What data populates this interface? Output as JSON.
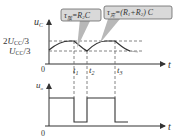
{
  "top_plot": {
    "y_label": "u",
    "y_label_sub": "C",
    "x_label": "t",
    "origin": "0",
    "levels": [
      {
        "label_coef": "2",
        "label_var": "U",
        "label_sub": "CC",
        "label_div": "/3"
      },
      {
        "label_coef": "",
        "label_var": "U",
        "label_sub": "CC",
        "label_div": "/3"
      }
    ],
    "callouts": [
      {
        "tau": "τ",
        "tau_sub": "放",
        "eq": "=R",
        "r_sub": "2",
        "tail": "C"
      },
      {
        "tau": "τ",
        "tau_sub": "充",
        "eq": "=(R",
        "r1_sub": "1",
        "mid": "+R",
        "r2_sub": "2",
        "tail": ") C"
      }
    ],
    "time_marks": [
      {
        "t": "t",
        "sub": "1"
      },
      {
        "t": "t",
        "sub": "2"
      },
      {
        "t": "t",
        "sub": "3"
      }
    ]
  },
  "bottom_plot": {
    "y_label": "u",
    "y_label_sub": "o",
    "x_label": "t",
    "origin": "0"
  },
  "colors": {
    "line": "#333333",
    "dash": "#666666",
    "callout_fill": "#b8b8b8",
    "callout_box": "#d9d9d9"
  }
}
